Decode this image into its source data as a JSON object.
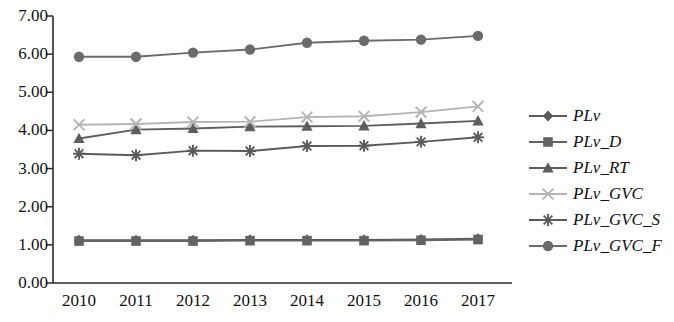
{
  "chart_data": {
    "type": "line",
    "title": "",
    "xlabel": "",
    "ylabel": "",
    "categories": [
      "2010",
      "2011",
      "2012",
      "2013",
      "2014",
      "2015",
      "2016",
      "2017"
    ],
    "x": [
      2010,
      2011,
      2012,
      2013,
      2014,
      2015,
      2016,
      2017
    ],
    "ylim": [
      0.0,
      7.0
    ],
    "yticks": [
      "0.00",
      "1.00",
      "2.00",
      "3.00",
      "4.00",
      "5.00",
      "6.00",
      "7.00"
    ],
    "ytick_values": [
      0,
      1,
      2,
      3,
      4,
      5,
      6,
      7
    ],
    "grid": false,
    "legend_position": "right",
    "series": [
      {
        "name": "PLv",
        "marker": "diamond",
        "color": "#595959",
        "values": [
          1.12,
          1.12,
          1.12,
          1.13,
          1.13,
          1.13,
          1.14,
          1.16
        ]
      },
      {
        "name": "PLv_D",
        "marker": "square",
        "color": "#636363",
        "values": [
          1.1,
          1.1,
          1.1,
          1.11,
          1.11,
          1.11,
          1.12,
          1.14
        ]
      },
      {
        "name": "PLv_RT",
        "marker": "triangle",
        "color": "#5e5e5e",
        "values": [
          3.79,
          4.02,
          4.05,
          4.1,
          4.11,
          4.12,
          4.18,
          4.25
        ]
      },
      {
        "name": "PLv_GVC",
        "marker": "x-light",
        "color": "#b4b4b4",
        "values": [
          4.15,
          4.17,
          4.22,
          4.23,
          4.35,
          4.37,
          4.48,
          4.63
        ]
      },
      {
        "name": "PLv_GVC_S",
        "marker": "star",
        "color": "#5a5a5a",
        "values": [
          3.39,
          3.35,
          3.47,
          3.46,
          3.59,
          3.6,
          3.7,
          3.82
        ]
      },
      {
        "name": "PLv_GVC_F",
        "marker": "circle",
        "color": "#6b6b6b",
        "values": [
          5.93,
          5.93,
          6.04,
          6.12,
          6.3,
          6.35,
          6.38,
          6.48
        ]
      }
    ]
  },
  "axes": {
    "x_left_px": 53,
    "x_right_px": 512,
    "y_top_px": 16,
    "y_bottom_px": 283,
    "first_point_px": 79,
    "point_spacing_px": 57
  }
}
